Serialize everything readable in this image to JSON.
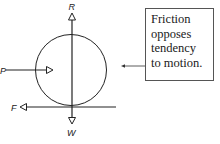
{
  "diagram": {
    "forces": [
      {
        "label": "R",
        "direction": "up"
      },
      {
        "label": "P",
        "direction": "right"
      },
      {
        "label": "F",
        "direction": "left"
      },
      {
        "label": "W",
        "direction": "down"
      }
    ],
    "note": {
      "lines": [
        "Friction",
        "opposes",
        "tendency",
        "to motion."
      ]
    }
  }
}
